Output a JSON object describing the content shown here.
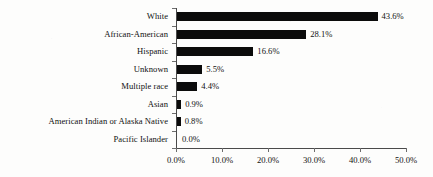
{
  "chart_data": {
    "type": "bar",
    "orientation": "horizontal",
    "title": "",
    "xlabel": "",
    "ylabel": "",
    "categories": [
      "White",
      "African-American",
      "Hispanic",
      "Unknown",
      "Multiple race",
      "Asian",
      "American Indian or Alaska Native",
      "Pacific Islander"
    ],
    "values": [
      43.6,
      28.1,
      16.6,
      5.5,
      4.4,
      0.9,
      0.8,
      0.0
    ],
    "value_labels": [
      "43.6%",
      "28.1%",
      "16.6%",
      "5.5%",
      "4.4%",
      "0.9%",
      "0.8%",
      "0.0%"
    ],
    "xlim": [
      0,
      50
    ],
    "xticks": [
      0,
      10,
      20,
      30,
      40,
      50
    ],
    "xtick_labels": [
      "0.0%",
      "10.0%",
      "20.0%",
      "30.0%",
      "40.0%",
      "50.0%"
    ],
    "grid": false,
    "legend": null,
    "bar_color": "#0b0b0b",
    "axis_color": "#4a4a4a",
    "background_color": "#fdfdfc"
  }
}
